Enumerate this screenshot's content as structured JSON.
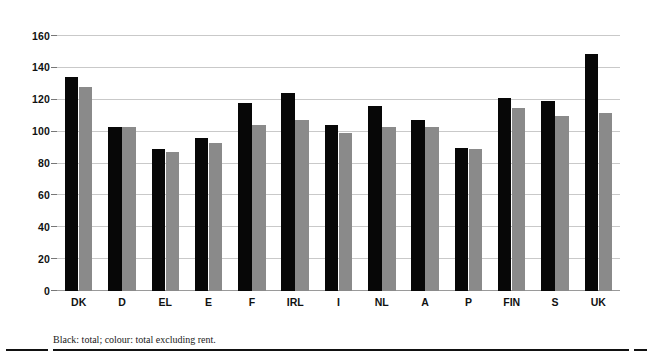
{
  "chart_data": {
    "type": "bar",
    "title": "",
    "subtitle": "",
    "xlabel": "",
    "ylabel": "",
    "ylim": [
      0,
      160
    ],
    "yticks": [
      0,
      20,
      40,
      60,
      80,
      100,
      120,
      140,
      160
    ],
    "grid": true,
    "legend_position": "none",
    "categories": [
      "DK",
      "D",
      "EL",
      "E",
      "F",
      "IRL",
      "I",
      "NL",
      "A",
      "P",
      "FIN",
      "S",
      "UK"
    ],
    "series": [
      {
        "name": "total",
        "color": "#070707",
        "values": [
          134,
          103,
          89,
          96,
          118,
          124,
          104,
          116,
          107,
          90,
          121,
          119,
          149
        ]
      },
      {
        "name": "total excluding rent",
        "color": "#8a8a8a",
        "values": [
          128,
          103,
          87,
          93,
          104,
          107,
          99,
          103,
          103,
          89,
          115,
          110,
          112
        ]
      }
    ],
    "annotations": [
      "Black: total; colour: total excluding rent."
    ]
  },
  "figure": {
    "footnote": "Black: total; colour: total excluding rent."
  },
  "colors": {
    "total_bar": "#070707",
    "exrent_bar": "#8a8a8a",
    "gridline": "#c9c9c9",
    "text": "#111111",
    "rule": "#111111",
    "background": "#ffffff"
  }
}
